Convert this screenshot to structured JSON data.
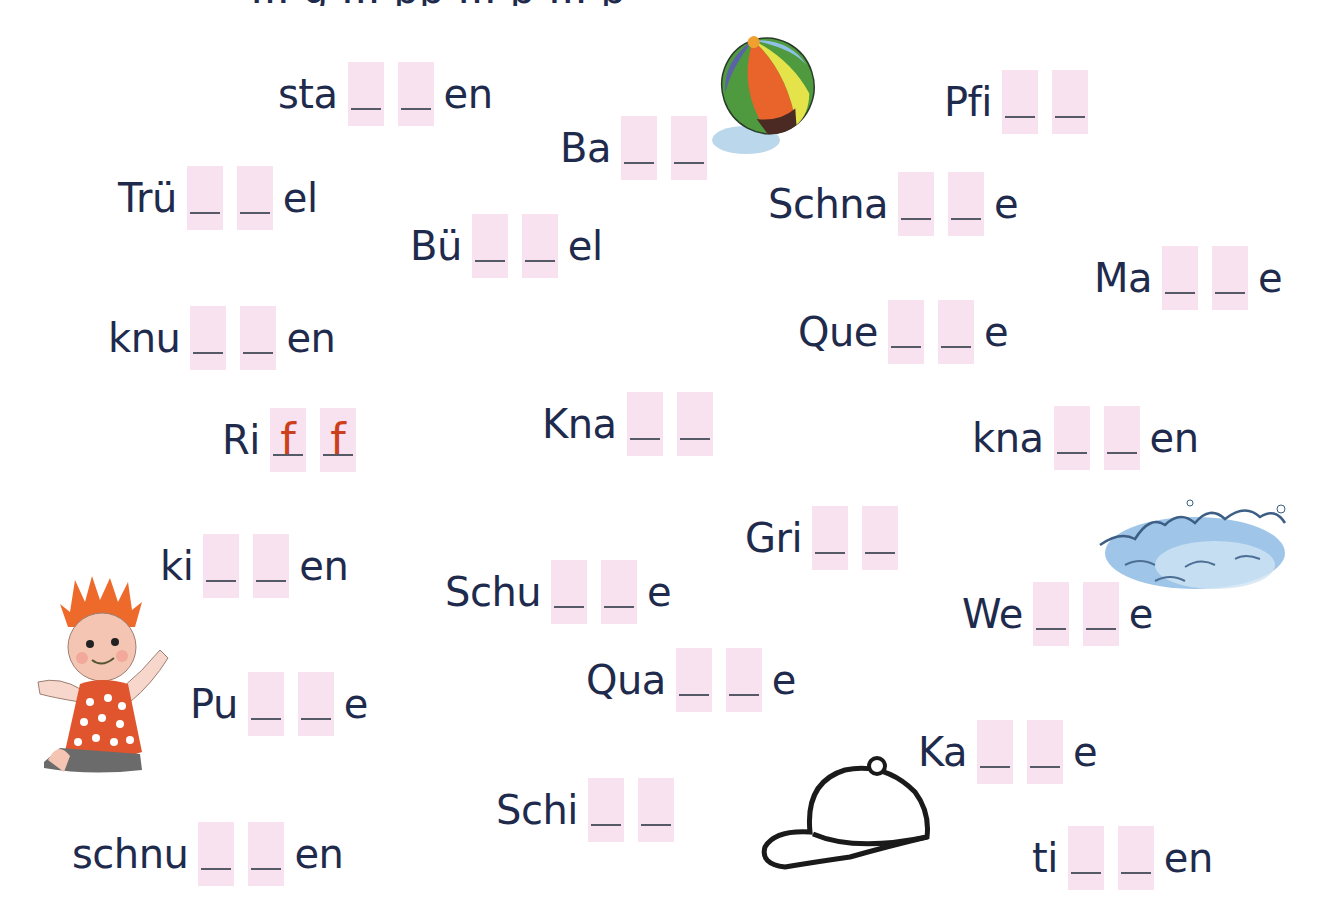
{
  "worksheet": {
    "heading_partial": "… g … pp … p … p",
    "colors": {
      "text": "#1f2b4d",
      "box": "#f9e2ef",
      "box_line": "#555a66",
      "example_fill": "#cc3f1c"
    },
    "items": [
      {
        "prefix": "sta",
        "suffix": "en",
        "fill": [
          "",
          ""
        ]
      },
      {
        "prefix": "Ba",
        "suffix": "",
        "fill": [
          "",
          ""
        ]
      },
      {
        "prefix": "Pfi",
        "suffix": "",
        "fill": [
          "",
          ""
        ]
      },
      {
        "prefix": "Trü",
        "suffix": "el",
        "fill": [
          "",
          ""
        ]
      },
      {
        "prefix": "Schna",
        "suffix": "e",
        "fill": [
          "",
          ""
        ]
      },
      {
        "prefix": "Bü",
        "suffix": "el",
        "fill": [
          "",
          ""
        ]
      },
      {
        "prefix": "Ma",
        "suffix": "e",
        "fill": [
          "",
          ""
        ]
      },
      {
        "prefix": "knu",
        "suffix": "en",
        "fill": [
          "",
          ""
        ]
      },
      {
        "prefix": "Que",
        "suffix": "e",
        "fill": [
          "",
          ""
        ]
      },
      {
        "prefix": "Ri",
        "suffix": "",
        "fill": [
          "f",
          "f"
        ]
      },
      {
        "prefix": "Kna",
        "suffix": "",
        "fill": [
          "",
          ""
        ]
      },
      {
        "prefix": "kna",
        "suffix": "en",
        "fill": [
          "",
          ""
        ]
      },
      {
        "prefix": "Gri",
        "suffix": "",
        "fill": [
          "",
          ""
        ]
      },
      {
        "prefix": "ki",
        "suffix": "en",
        "fill": [
          "",
          ""
        ]
      },
      {
        "prefix": "Schu",
        "suffix": "e",
        "fill": [
          "",
          ""
        ]
      },
      {
        "prefix": "We",
        "suffix": "e",
        "fill": [
          "",
          ""
        ]
      },
      {
        "prefix": "Qua",
        "suffix": "e",
        "fill": [
          "",
          ""
        ]
      },
      {
        "prefix": "Pu",
        "suffix": "e",
        "fill": [
          "",
          ""
        ]
      },
      {
        "prefix": "Ka",
        "suffix": "e",
        "fill": [
          "",
          ""
        ]
      },
      {
        "prefix": "Schi",
        "suffix": "",
        "fill": [
          "",
          ""
        ]
      },
      {
        "prefix": "schnu",
        "suffix": "en",
        "fill": [
          "",
          ""
        ]
      },
      {
        "prefix": "ti",
        "suffix": "en",
        "fill": [
          "",
          ""
        ]
      }
    ],
    "illustrations": [
      {
        "name": "beach-ball"
      },
      {
        "name": "doll"
      },
      {
        "name": "waves"
      },
      {
        "name": "cap"
      }
    ]
  }
}
